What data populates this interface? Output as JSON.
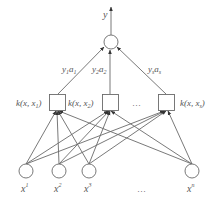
{
  "diagram": {
    "type": "support vector machine network",
    "output": {
      "label": "y"
    },
    "weights": [
      {
        "label": "y",
        "sub": "1",
        "label2": "a",
        "sub2": "1"
      },
      {
        "label": "y",
        "sub": "2",
        "label2": "a",
        "sub2": "2"
      },
      {
        "label": "y",
        "sub": "s",
        "label2": "a",
        "sub2": "s"
      }
    ],
    "kernels": [
      {
        "label": "k(x, x",
        "sub": "1",
        "close": ")"
      },
      {
        "label": "k(x, x",
        "sub": "2",
        "close": ")"
      },
      {
        "label": "k(x, x",
        "sub": "s",
        "close": ")"
      }
    ],
    "kernel_ellipsis": "…",
    "inputs": [
      {
        "label": "x",
        "sup": "1"
      },
      {
        "label": "x",
        "sup": "2"
      },
      {
        "label": "x",
        "sup": "3"
      },
      {
        "label": "x",
        "sup": "n"
      }
    ],
    "input_ellipsis": "…",
    "colors": {
      "line": "#6a6a6a",
      "text": "#555555",
      "background": "#ffffff"
    }
  }
}
